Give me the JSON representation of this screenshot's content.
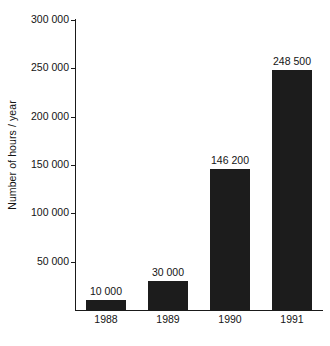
{
  "chart_data": {
    "type": "bar",
    "title": "",
    "subtitle": "",
    "xlabel": "",
    "ylabel": "Number of hours / year",
    "categories": [
      "1988",
      "1989",
      "1990",
      "1991"
    ],
    "values": [
      10000,
      30000,
      146200,
      248500
    ],
    "value_labels": [
      "10 000",
      "30 000",
      "146 200",
      "248 500"
    ],
    "series": [
      {
        "name": "Number of hours / year",
        "values": [
          10000,
          30000,
          146200,
          248500
        ]
      }
    ],
    "ylim": [
      0,
      300000
    ],
    "ytick_values": [
      0,
      50000,
      100000,
      150000,
      200000,
      250000,
      300000
    ],
    "ytick_labels": [
      "0",
      "50 000",
      "100 000",
      "150 000",
      "200 000",
      "250 000",
      "300 000"
    ],
    "ytick_labels_shown": [
      "50 000",
      "100 000",
      "150 000",
      "200 000",
      "250 000",
      "300 000"
    ],
    "grid": false,
    "legend": false,
    "legend_position": "none",
    "bar_color": "#1c1c1c",
    "axis_color": "#1a1a1a",
    "text_color": "#141414",
    "background_color": "#ffffff",
    "thousands_separator": " "
  }
}
